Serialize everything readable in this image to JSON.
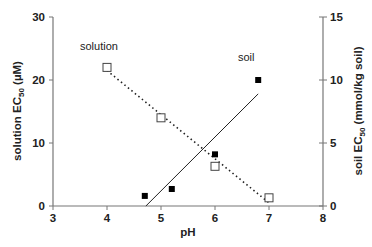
{
  "chart_data": {
    "type": "scatter",
    "title": "",
    "xlabel": "pH",
    "ylabel_left": "solution EC50 (µM)",
    "ylabel_right": "soil EC50 (mmol/kg soil)",
    "xlim": [
      3,
      8
    ],
    "ylim_left": [
      0,
      30
    ],
    "ylim_right": [
      0,
      15
    ],
    "x_ticks": [
      "3",
      "4",
      "5",
      "6",
      "7",
      "8"
    ],
    "y_ticks_left": [
      "0",
      "10",
      "20",
      "30"
    ],
    "y_ticks_right": [
      "0",
      "5",
      "10",
      "15"
    ],
    "grid": false,
    "legend": "none (inline annotations)",
    "annotations": [
      "solution",
      "soil"
    ],
    "series": [
      {
        "name": "solution",
        "axis": "left",
        "marker": "open-square",
        "x": [
          4,
          5,
          6,
          7
        ],
        "values": [
          22,
          14,
          6.3,
          1.3
        ],
        "trendline": {
          "style": "dotted",
          "from": [
            4,
            21.5
          ],
          "to": [
            7,
            0.5
          ]
        }
      },
      {
        "name": "soil",
        "axis": "right",
        "marker": "filled-square",
        "x": [
          4.7,
          5.2,
          6.0,
          6.8
        ],
        "values": [
          0.8,
          1.35,
          4.1,
          10
        ],
        "trendline": {
          "style": "solid",
          "from": [
            4.72,
            0
          ],
          "to": [
            6.8,
            8.9
          ]
        }
      }
    ]
  },
  "labels": {
    "xlabel": "pH",
    "ylabel_left_main": "solution EC",
    "ylabel_left_sub": "50",
    "ylabel_left_tail": " (µM)",
    "ylabel_right_main": "soil EC",
    "ylabel_right_sub": "50",
    "ylabel_right_tail": " (mmol/kg soil)",
    "annot_solution": "solution",
    "annot_soil": "soil"
  }
}
